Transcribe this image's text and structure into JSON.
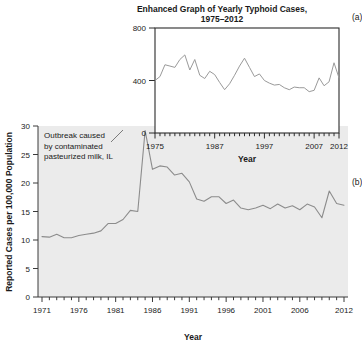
{
  "figure": {
    "panel_letters": [
      "(a)",
      "(b)"
    ]
  },
  "main": {
    "annotation": "Outbreak caused\nby contaminated\npasteurized milk, IL",
    "xlabel": "Year",
    "ylabel": "Reported Cases per 100,000 Population",
    "x_ticklabels": [
      "1971",
      "1976",
      "1981",
      "1986",
      "1991",
      "1996",
      "2001",
      "2006",
      "2012"
    ],
    "y_ticklabels": [
      "0",
      "5",
      "10",
      "15",
      "20",
      "25",
      "30"
    ],
    "plot_bg": "#ebebeb",
    "line_color": "#8c8c8c"
  },
  "inset": {
    "title_line1": "Enhanced Graph of Yearly Typhoid Cases,",
    "title_line2": "1975–2012",
    "xlabel": "Year",
    "x_ticklabels": [
      "1975",
      "1987",
      "1997",
      "2007",
      "2012"
    ],
    "y_ticklabels": [
      "0",
      "400",
      "800"
    ],
    "plot_bg": "#ffffff",
    "border_color": "#2b2b2b",
    "line_color": "#9a9a9a"
  },
  "chart_data": [
    {
      "type": "line",
      "id": "main-typhoid-rate",
      "title": "",
      "xlabel": "Year",
      "ylabel": "Reported Cases per 100,000 Population",
      "xlim": [
        1971,
        2012
      ],
      "ylim": [
        0,
        30
      ],
      "xticks": [
        1971,
        1976,
        1981,
        1986,
        1991,
        1996,
        2001,
        2006,
        2012
      ],
      "yticks": [
        0,
        5,
        10,
        15,
        20,
        25,
        30
      ],
      "grid": false,
      "legend": "none",
      "annotations": [
        {
          "text": "Outbreak caused by contaminated pasteurized milk, IL",
          "points_to_x": 1985,
          "points_to_y": 29.2
        }
      ],
      "x": [
        1971,
        1972,
        1973,
        1974,
        1975,
        1976,
        1977,
        1978,
        1979,
        1980,
        1981,
        1982,
        1983,
        1984,
        1985,
        1986,
        1987,
        1988,
        1989,
        1990,
        1991,
        1992,
        1993,
        1994,
        1995,
        1996,
        1997,
        1998,
        1999,
        2000,
        2001,
        2002,
        2003,
        2004,
        2005,
        2006,
        2007,
        2008,
        2009,
        2010,
        2011,
        2012
      ],
      "y": [
        10.6,
        10.5,
        11.0,
        10.4,
        10.4,
        10.8,
        11.0,
        11.2,
        11.6,
        12.9,
        12.9,
        13.6,
        15.2,
        15.0,
        29.2,
        22.4,
        23.0,
        22.8,
        21.4,
        21.7,
        20.2,
        17.2,
        16.8,
        17.6,
        17.6,
        16.4,
        17.0,
        15.6,
        15.3,
        15.6,
        16.1,
        15.5,
        16.3,
        15.6,
        16.0,
        15.3,
        16.3,
        15.8,
        13.9,
        18.6,
        16.4,
        16.1
      ]
    },
    {
      "type": "line",
      "id": "inset-typhoid-cases",
      "title": "Enhanced Graph of Yearly Typhoid Cases, 1975–2012",
      "xlabel": "Year",
      "ylabel": "",
      "xlim": [
        1975,
        2012
      ],
      "ylim": [
        0,
        800
      ],
      "xticks": [
        1975,
        1987,
        1997,
        2007,
        2012
      ],
      "yticks": [
        0,
        400,
        800
      ],
      "grid": false,
      "legend": "none",
      "x": [
        1975,
        1976,
        1977,
        1978,
        1979,
        1980,
        1981,
        1982,
        1983,
        1984,
        1985,
        1986,
        1987,
        1988,
        1989,
        1990,
        1991,
        1992,
        1993,
        1994,
        1995,
        1996,
        1997,
        1998,
        1999,
        2000,
        2001,
        2002,
        2003,
        2004,
        2005,
        2006,
        2007,
        2008,
        2009,
        2010,
        2011,
        2012
      ],
      "y": [
        400,
        430,
        520,
        510,
        500,
        560,
        595,
        480,
        560,
        440,
        415,
        470,
        445,
        385,
        330,
        375,
        440,
        510,
        570,
        500,
        430,
        450,
        400,
        380,
        365,
        370,
        345,
        330,
        350,
        345,
        345,
        315,
        325,
        420,
        360,
        390,
        535,
        420
      ]
    }
  ]
}
